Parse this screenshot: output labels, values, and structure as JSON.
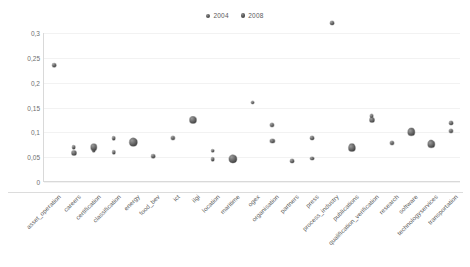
{
  "chart_data": {
    "type": "scatter",
    "title": "",
    "xlabel": "",
    "ylabel": "",
    "ylim": [
      0,
      0.3
    ],
    "yticks": [
      0,
      0.05,
      0.1,
      0.15,
      0.2,
      0.25,
      0.3
    ],
    "ytick_labels": [
      "0",
      "0,05",
      "0,1",
      "0,15",
      "0,2",
      "0,25",
      "0,3"
    ],
    "grid": false,
    "legend_position": "top-center",
    "marker_style": "bubble",
    "categories": [
      "asset_operation",
      "careers",
      "certification",
      "classification",
      "energy",
      "food_bev",
      "ict",
      "ilgi",
      "location",
      "maritime",
      "ogex",
      "organisation",
      "partners",
      "press",
      "process_industry",
      "publications",
      "qualification_verification",
      "research",
      "software",
      "technologyservices",
      "transportation"
    ],
    "series": [
      {
        "name": "2004",
        "color": "#5c5c5c",
        "values": [
          0.235,
          0.07,
          0.063,
          0.088,
          0.084,
          0.052,
          0.088,
          0.127,
          0.063,
          0.05,
          0.16,
          0.115,
          0.042,
          0.088,
          0.32,
          0.073,
          0.132,
          0.078,
          0.104,
          0.08,
          0.118
        ],
        "sizes": [
          3.6,
          3.6,
          3.6,
          3.6,
          3.8,
          3.6,
          4.2,
          4.4,
          3.6,
          3.8,
          3.8,
          4.0,
          3.8,
          3.8,
          3.8,
          5.2,
          3.8,
          4.0,
          4.2,
          4.0,
          3.8
        ]
      },
      {
        "name": "2008",
        "color": "#4a4a4a",
        "values": [
          null,
          0.059,
          0.07,
          0.06,
          0.08,
          null,
          null,
          0.124,
          0.046,
          0.047,
          null,
          0.083,
          null,
          0.047,
          null,
          0.068,
          0.125,
          null,
          0.1,
          0.076,
          0.103
        ],
        "sizes": [
          0,
          5.0,
          6.4,
          3.4,
          7.4,
          0,
          0,
          7.0,
          3.6,
          8.2,
          0,
          4.2,
          0,
          3.8,
          0,
          7.2,
          5.0,
          0,
          6.4,
          6.4,
          4.0
        ]
      }
    ],
    "legend": [
      {
        "label": "2004"
      },
      {
        "label": "2008"
      }
    ]
  }
}
